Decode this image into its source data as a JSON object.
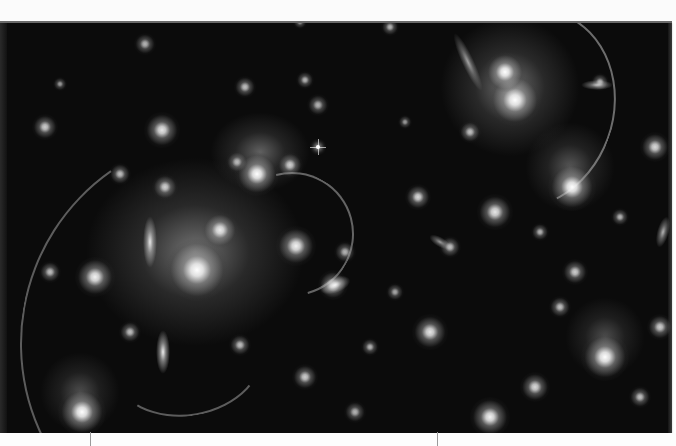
{
  "image": {
    "subject": "galaxy cluster with gravitational lensing arcs",
    "background_color": "#0b0b0b",
    "frame_border_color": "#6a6a6a"
  },
  "halos": [
    {
      "x": 195,
      "y": 250,
      "rx": 110,
      "ry": 95,
      "a": 0.55
    },
    {
      "x": 510,
      "y": 85,
      "rx": 70,
      "ry": 70,
      "a": 0.55
    },
    {
      "x": 260,
      "y": 150,
      "rx": 50,
      "ry": 40,
      "a": 0.45
    },
    {
      "x": 570,
      "y": 165,
      "rx": 45,
      "ry": 45,
      "a": 0.4
    },
    {
      "x": 605,
      "y": 335,
      "rx": 40,
      "ry": 40,
      "a": 0.35
    },
    {
      "x": 80,
      "y": 390,
      "rx": 40,
      "ry": 40,
      "a": 0.35
    }
  ],
  "galaxies": [
    {
      "x": 197,
      "y": 268,
      "r": 14,
      "b": 1.0
    },
    {
      "x": 220,
      "y": 228,
      "r": 8,
      "b": 0.9
    },
    {
      "x": 257,
      "y": 172,
      "r": 10,
      "b": 1.0
    },
    {
      "x": 290,
      "y": 163,
      "r": 6,
      "b": 0.8
    },
    {
      "x": 237,
      "y": 160,
      "r": 5,
      "b": 0.7
    },
    {
      "x": 515,
      "y": 98,
      "r": 12,
      "b": 1.0
    },
    {
      "x": 505,
      "y": 70,
      "r": 9,
      "b": 1.0
    },
    {
      "x": 572,
      "y": 185,
      "r": 11,
      "b": 1.0
    },
    {
      "x": 605,
      "y": 355,
      "r": 11,
      "b": 1.0
    },
    {
      "x": 82,
      "y": 410,
      "r": 11,
      "b": 1.0
    },
    {
      "x": 95,
      "y": 275,
      "r": 9,
      "b": 0.95
    },
    {
      "x": 162,
      "y": 128,
      "r": 8,
      "b": 0.9
    },
    {
      "x": 165,
      "y": 185,
      "r": 6,
      "b": 0.8
    },
    {
      "x": 296,
      "y": 244,
      "r": 9,
      "b": 0.95
    },
    {
      "x": 333,
      "y": 283,
      "r": 7,
      "b": 0.85
    },
    {
      "x": 345,
      "y": 250,
      "r": 5,
      "b": 0.7
    },
    {
      "x": 495,
      "y": 210,
      "r": 8,
      "b": 0.9
    },
    {
      "x": 418,
      "y": 195,
      "r": 6,
      "b": 0.85
    },
    {
      "x": 430,
      "y": 330,
      "r": 8,
      "b": 0.9
    },
    {
      "x": 535,
      "y": 385,
      "r": 7,
      "b": 0.85
    },
    {
      "x": 575,
      "y": 270,
      "r": 6,
      "b": 0.8
    },
    {
      "x": 490,
      "y": 415,
      "r": 9,
      "b": 0.95
    },
    {
      "x": 120,
      "y": 172,
      "r": 5,
      "b": 0.75
    },
    {
      "x": 50,
      "y": 270,
      "r": 5,
      "b": 0.75
    },
    {
      "x": 245,
      "y": 85,
      "r": 5,
      "b": 0.75
    },
    {
      "x": 305,
      "y": 78,
      "r": 4,
      "b": 0.7
    },
    {
      "x": 318,
      "y": 103,
      "r": 5,
      "b": 0.7
    },
    {
      "x": 145,
      "y": 42,
      "r": 5,
      "b": 0.7
    },
    {
      "x": 390,
      "y": 25,
      "r": 4,
      "b": 0.7
    },
    {
      "x": 655,
      "y": 145,
      "r": 7,
      "b": 0.85
    },
    {
      "x": 600,
      "y": 80,
      "r": 4,
      "b": 0.7
    },
    {
      "x": 660,
      "y": 325,
      "r": 6,
      "b": 0.8
    },
    {
      "x": 240,
      "y": 343,
      "r": 5,
      "b": 0.75
    },
    {
      "x": 130,
      "y": 330,
      "r": 5,
      "b": 0.75
    },
    {
      "x": 305,
      "y": 375,
      "r": 6,
      "b": 0.8
    },
    {
      "x": 370,
      "y": 345,
      "r": 4,
      "b": 0.7
    },
    {
      "x": 450,
      "y": 245,
      "r": 5,
      "b": 0.75
    },
    {
      "x": 470,
      "y": 130,
      "r": 5,
      "b": 0.75
    },
    {
      "x": 540,
      "y": 230,
      "r": 4,
      "b": 0.7
    },
    {
      "x": 560,
      "y": 305,
      "r": 5,
      "b": 0.75
    },
    {
      "x": 395,
      "y": 290,
      "r": 4,
      "b": 0.65
    },
    {
      "x": 640,
      "y": 395,
      "r": 5,
      "b": 0.75
    },
    {
      "x": 355,
      "y": 410,
      "r": 5,
      "b": 0.7
    },
    {
      "x": 45,
      "y": 125,
      "r": 6,
      "b": 0.8
    },
    {
      "x": 60,
      "y": 82,
      "r": 3,
      "b": 0.6
    },
    {
      "x": 405,
      "y": 120,
      "r": 3,
      "b": 0.6
    },
    {
      "x": 620,
      "y": 215,
      "r": 4,
      "b": 0.7
    },
    {
      "x": 300,
      "y": 20,
      "r": 3,
      "b": 0.6
    }
  ],
  "elongated": [
    {
      "x": 150,
      "y": 240,
      "w": 7,
      "h": 26,
      "rot": 0,
      "b": 0.9
    },
    {
      "x": 163,
      "y": 350,
      "w": 7,
      "h": 22,
      "rot": 0,
      "b": 0.95
    },
    {
      "x": 468,
      "y": 60,
      "w": 6,
      "h": 32,
      "rot": -25,
      "b": 0.6
    },
    {
      "x": 597,
      "y": 83,
      "w": 16,
      "h": 5,
      "rot": 0,
      "b": 0.7
    },
    {
      "x": 663,
      "y": 230,
      "w": 6,
      "h": 16,
      "rot": 15,
      "b": 0.7
    },
    {
      "x": 440,
      "y": 240,
      "w": 12,
      "h": 5,
      "rot": 30,
      "b": 0.6
    },
    {
      "x": 335,
      "y": 283,
      "w": 16,
      "h": 8,
      "rot": -20,
      "b": 0.9
    }
  ],
  "arcs": [
    {
      "x": 20,
      "y": 130,
      "w": 420,
      "h": 420,
      "bw": 2,
      "side": "left",
      "rot": 10,
      "a": 0.45
    },
    {
      "x": 440,
      "y": 5,
      "w": 170,
      "h": 200,
      "bw": 2,
      "side": "top-right",
      "rot": 20,
      "a": 0.55
    },
    {
      "x": 230,
      "y": 170,
      "w": 120,
      "h": 120,
      "bw": 2,
      "side": "top-right",
      "rot": 30,
      "a": 0.5
    },
    {
      "x": 110,
      "y": 300,
      "w": 150,
      "h": 110,
      "bw": 2,
      "side": "bottom",
      "rot": -10,
      "a": 0.45
    }
  ],
  "stars": [
    {
      "x": 318,
      "y": 145,
      "r": 2
    }
  ],
  "ticks": [
    {
      "x": 90
    },
    {
      "x": 437
    }
  ]
}
